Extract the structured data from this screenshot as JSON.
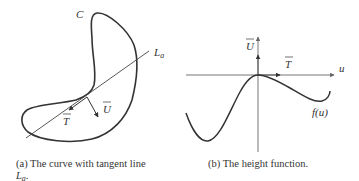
{
  "figure_a": {
    "curve_label": "C",
    "line_label": "L",
    "line_label_sub": "a",
    "tangent_vector_label": "T",
    "normal_vector_label": "U",
    "caption_line1": "(a) The curve with tangent line",
    "caption_line2_main": "L",
    "caption_line2_sub": "a",
    "caption_line2_end": "."
  },
  "figure_b": {
    "vertical_axis_label": "U",
    "horizontal_axis_label": "u",
    "tangent_vector_label": "T",
    "function_label": "f(u)",
    "caption": "(b) The height function."
  },
  "colors": {
    "stroke": "#333333",
    "axis": "#666666",
    "background": "#ffffff"
  }
}
